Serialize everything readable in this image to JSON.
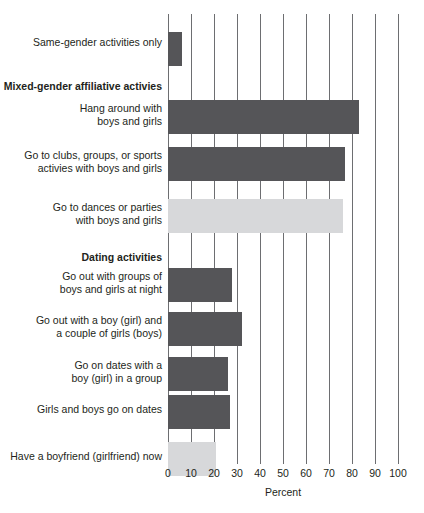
{
  "chart_data": {
    "type": "bar",
    "orientation": "horizontal",
    "title": "",
    "xlabel": "Percent",
    "ylabel": "",
    "xlim": [
      0,
      100
    ],
    "xticks": [
      0,
      10,
      20,
      30,
      40,
      50,
      60,
      70,
      80,
      90,
      100
    ],
    "xtick_labels": [
      "0",
      "10",
      "20",
      "30",
      "40",
      "50",
      "60",
      "70",
      "80",
      "90",
      "100"
    ],
    "grid": true,
    "legend": false,
    "colors": {
      "dark_bar": "#555558",
      "light_bar": "#d7d8da",
      "gridline": "#6d6e71",
      "text": "#231f20"
    },
    "categories": [
      "Same-gender activities only",
      "Hang around with boys and girls",
      "Go to clubs, groups, or sports activies with boys and girls",
      "Go to dances or parties with boys and girls",
      "Go out with groups of boys and girls at night",
      "Go out with a boy (girl) and a couple of girls (boys)",
      "Go on dates with a boy (girl) in a group",
      "Girls and boys go on dates",
      "Have a boyfriend (girlfriend) now"
    ],
    "values": [
      6,
      83,
      77,
      76,
      28,
      32,
      26,
      27,
      21
    ],
    "group_headers": [
      "Mixed-gender affiliative activies",
      "Dating activities"
    ]
  },
  "rows": [
    {
      "kind": "bar",
      "label": "Same-gender activities only",
      "value": 6,
      "shade": "dark",
      "top": 18,
      "label_top": 22
    },
    {
      "kind": "header",
      "label": "Mixed-gender affiliative activies",
      "top": 66,
      "label_top": 66
    },
    {
      "kind": "bar",
      "label": "Hang around with\nboys and girls",
      "value": 83,
      "shade": "dark",
      "top": 86,
      "label_top": 88
    },
    {
      "kind": "bar",
      "label": "Go to clubs, groups, or sports\nactivies with boys and girls",
      "value": 77,
      "shade": "dark",
      "top": 133,
      "label_top": 135
    },
    {
      "kind": "bar",
      "label": "Go to dances or parties\nwith boys and girls",
      "value": 76,
      "shade": "light",
      "top": 185,
      "label_top": 187
    },
    {
      "kind": "header",
      "label": "Dating activities",
      "top": 237,
      "label_top": 237
    },
    {
      "kind": "bar",
      "label": "Go out with groups of\nboys and girls at night",
      "value": 28,
      "shade": "dark",
      "top": 254,
      "label_top": 256
    },
    {
      "kind": "bar",
      "label": "Go out with a boy (girl) and\na couple of girls (boys)",
      "value": 32,
      "shade": "dark",
      "top": 298,
      "label_top": 300
    },
    {
      "kind": "bar",
      "label": "Go on dates with a\nboy (girl) in a group",
      "value": 26,
      "shade": "dark",
      "top": 343,
      "label_top": 345
    },
    {
      "kind": "bar",
      "label": "Girls and boys go on dates",
      "value": 27,
      "shade": "dark",
      "top": 381,
      "label_top": 389
    },
    {
      "kind": "bar",
      "label": "Have a boyfriend (girlfriend) now",
      "value": 21,
      "shade": "light",
      "top": 428,
      "label_top": 436
    }
  ],
  "axis": {
    "title": "Percent"
  }
}
